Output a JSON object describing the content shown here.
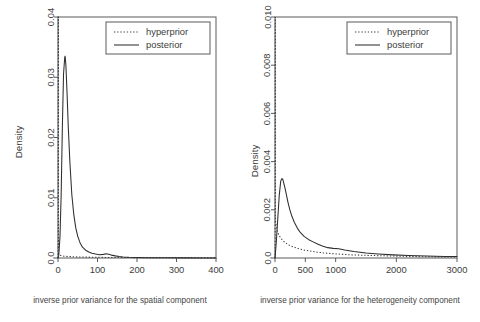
{
  "figure": {
    "background_color": "#ffffff",
    "line_color": "#2e2e2e",
    "axis_color": "#5a5a5a"
  },
  "chart_data": [
    {
      "type": "line",
      "panel": "left",
      "title": "",
      "xlabel": "inverse prior variance for the spatial component",
      "ylabel": "Density",
      "xlim": [
        0,
        400
      ],
      "ylim": [
        0,
        0.04
      ],
      "xticks": [
        0,
        100,
        200,
        300,
        400
      ],
      "xtick_labels": [
        "0",
        "100",
        "200",
        "300",
        "400"
      ],
      "yticks": [
        0,
        0.01,
        0.02,
        0.03,
        0.04
      ],
      "ytick_labels": [
        "0.0",
        "0.01",
        "0.02",
        "0.03",
        "0.04"
      ],
      "grid": false,
      "legend_position": "top-right",
      "series": [
        {
          "name": "hyperprior",
          "style": "dotted",
          "x": [
            0.3,
            0.6,
            1,
            1,
            2,
            4,
            8,
            15,
            25,
            40,
            60,
            90,
            120,
            160,
            200,
            250,
            300,
            350,
            400
          ],
          "values": [
            0.0,
            0.04,
            0.04,
            0.0009,
            0.0007,
            0.0005,
            0.0004,
            0.0003,
            0.00025,
            0.0002,
            0.00016,
            0.00013,
            0.0001,
            8e-05,
            6e-05,
            5e-05,
            4e-05,
            3e-05,
            2e-05
          ]
        },
        {
          "name": "posterior",
          "style": "solid",
          "x": [
            0,
            2,
            5,
            8,
            11,
            14,
            17,
            18,
            20,
            23,
            26,
            30,
            35,
            40,
            45,
            50,
            56,
            62,
            70,
            78,
            86,
            95,
            105,
            115,
            122,
            128,
            135,
            145,
            155,
            165,
            180,
            200,
            230,
            270,
            320,
            370,
            400
          ],
          "values": [
            0.0,
            0.0005,
            0.0035,
            0.0105,
            0.0215,
            0.0305,
            0.0333,
            0.0335,
            0.032,
            0.0272,
            0.0218,
            0.016,
            0.0105,
            0.0072,
            0.005,
            0.0036,
            0.0025,
            0.0018,
            0.0013,
            0.001,
            0.0008,
            0.00065,
            0.00055,
            0.0006,
            0.0007,
            0.00062,
            0.00048,
            0.00035,
            0.00025,
            0.00018,
            0.00012,
            8e-05,
            5e-05,
            3e-05,
            2e-05,
            1e-05,
            1e-05
          ]
        }
      ]
    },
    {
      "type": "line",
      "panel": "right",
      "title": "",
      "xlabel": "inverse prior variance for the heterogeneity component",
      "ylabel": "Density",
      "xlim": [
        0,
        3000
      ],
      "ylim": [
        0,
        0.01
      ],
      "xticks": [
        0,
        500,
        1000,
        2000,
        3000
      ],
      "xtick_labels": [
        "0",
        "500",
        "1000",
        "2000",
        "3000"
      ],
      "yticks": [
        0,
        0.002,
        0.004,
        0.006,
        0.008,
        0.01
      ],
      "ytick_labels": [
        "0.0",
        "0.002",
        "0.004",
        "0.006",
        "0.008",
        "0.010"
      ],
      "grid": false,
      "legend_position": "top-right",
      "series": [
        {
          "name": "hyperprior",
          "style": "dotted",
          "x": [
            3,
            5,
            5,
            20,
            40,
            70,
            110,
            160,
            220,
            300,
            400,
            520,
            650,
            800,
            1000,
            1250,
            1500,
            1800,
            2100,
            2500,
            3000
          ],
          "values": [
            0.0,
            0.01,
            0.0016,
            0.00135,
            0.0011,
            0.00092,
            0.00078,
            0.00065,
            0.00055,
            0.00046,
            0.00038,
            0.00031,
            0.00026,
            0.00021,
            0.00017,
            0.00013,
            0.00011,
            9e-05,
            7e-05,
            5e-05,
            4e-05
          ]
        },
        {
          "name": "posterior",
          "style": "solid",
          "x": [
            0,
            20,
            45,
            70,
            95,
            115,
            130,
            145,
            165,
            190,
            215,
            245,
            280,
            320,
            370,
            420,
            480,
            550,
            620,
            700,
            780,
            870,
            960,
            1050,
            1150,
            1300,
            1500,
            1700,
            1950,
            2200,
            2500,
            2800,
            3000
          ],
          "values": [
            0.0,
            0.0006,
            0.0016,
            0.0026,
            0.0032,
            0.0033,
            0.00325,
            0.0031,
            0.0029,
            0.0026,
            0.0023,
            0.002,
            0.00172,
            0.00147,
            0.00123,
            0.00105,
            0.0009,
            0.00077,
            0.00068,
            0.00058,
            0.0005,
            0.00043,
            0.0004,
            0.00038,
            0.00033,
            0.00027,
            0.00021,
            0.00017,
            0.00013,
            0.0001,
            8e-05,
            6e-05,
            6e-05
          ]
        }
      ]
    }
  ],
  "panels": {
    "left": {
      "legend": {
        "items": [
          {
            "label": "hyperprior",
            "style": "dotted"
          },
          {
            "label": "posterior",
            "style": "solid"
          }
        ]
      },
      "ylabel": "Density",
      "caption": "inverse prior variance for the spatial component",
      "xtick_labels": [
        "0",
        "100",
        "200",
        "300",
        "400"
      ],
      "ytick_labels": [
        "0.0",
        "0.01",
        "0.02",
        "0.03",
        "0.04"
      ]
    },
    "right": {
      "legend": {
        "items": [
          {
            "label": "hyperprior",
            "style": "dotted"
          },
          {
            "label": "posterior",
            "style": "solid"
          }
        ]
      },
      "ylabel": "Density",
      "caption": "inverse prior variance for the heterogeneity component",
      "xtick_labels": [
        "0",
        "500",
        "1000",
        "2000",
        "3000"
      ],
      "ytick_labels": [
        "0.0",
        "0.002",
        "0.004",
        "0.006",
        "0.008",
        "0.010"
      ]
    }
  }
}
